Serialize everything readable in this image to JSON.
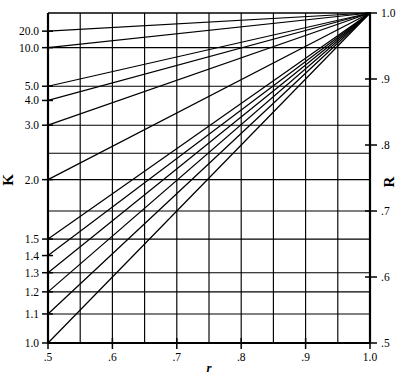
{
  "chart_data": {
    "type": "line",
    "title": "",
    "subtitle": "",
    "xlabel": "r",
    "ylabel": "K",
    "y2label": "R",
    "grid": true,
    "legend": null,
    "legend_position": "none",
    "xlim": [
      0.5,
      1.0
    ],
    "ylim_left_labels": [
      "1.0",
      "1.1",
      "1.2",
      "1.3",
      "1.4",
      "1.5",
      "2.0",
      "3.0",
      "4.0",
      "5.0",
      "10.0",
      "20.0"
    ],
    "ylim_right": [
      0.5,
      1.0
    ],
    "x_ticks": [
      {
        "value": 0.5,
        "label": ".5"
      },
      {
        "value": 0.6,
        "label": ".6"
      },
      {
        "value": 0.7,
        "label": ".7"
      },
      {
        "value": 0.8,
        "label": ".8"
      },
      {
        "value": 0.9,
        "label": ".9"
      },
      {
        "value": 1.0,
        "label": "1.0"
      }
    ],
    "y_left_ticks": [
      {
        "label": "20.0",
        "pos": 0.055
      },
      {
        "label": "10.0",
        "pos": 0.105
      },
      {
        "label": "5.0",
        "pos": 0.222
      },
      {
        "label": "4.0",
        "pos": 0.265
      },
      {
        "label": "3.0",
        "pos": 0.34
      },
      {
        "label": "2.0",
        "pos": 0.505
      },
      {
        "label": "1.5",
        "pos": 0.685
      },
      {
        "label": "1.4",
        "pos": 0.735
      },
      {
        "label": "1.3",
        "pos": 0.787
      },
      {
        "label": "1.2",
        "pos": 0.845
      },
      {
        "label": "1.1",
        "pos": 0.912
      },
      {
        "label": "1.0",
        "pos": 1.0
      }
    ],
    "y_right_ticks": [
      {
        "label": "1.0",
        "pos": 0.0
      },
      {
        "label": ".9",
        "pos": 0.2
      },
      {
        "label": ".8",
        "pos": 0.4
      },
      {
        "label": ".7",
        "pos": 0.6
      },
      {
        "label": ".6",
        "pos": 0.8
      },
      {
        "label": ".5",
        "pos": 1.0
      }
    ],
    "grid_x_divisions": 10,
    "grid_y_positions": [
      0.0,
      0.105,
      0.222,
      0.34,
      0.425,
      0.505,
      0.6,
      0.685,
      0.787,
      0.845,
      0.912,
      1.0
    ],
    "convergence_point": {
      "x": 1.0,
      "y": 0.0
    },
    "series": [
      {
        "name": "K=20.0",
        "start_pos": 0.055,
        "values": [
          0.055,
          0.0
        ]
      },
      {
        "name": "K=10.0",
        "start_pos": 0.105,
        "values": [
          0.105,
          0.0
        ]
      },
      {
        "name": "K=5.0",
        "start_pos": 0.222,
        "values": [
          0.222,
          0.0
        ]
      },
      {
        "name": "K=4.0",
        "start_pos": 0.265,
        "values": [
          0.265,
          0.0
        ]
      },
      {
        "name": "K=3.0",
        "start_pos": 0.34,
        "values": [
          0.34,
          0.0
        ]
      },
      {
        "name": "K=2.0",
        "start_pos": 0.505,
        "values": [
          0.505,
          0.0
        ]
      },
      {
        "name": "K=1.5",
        "start_pos": 0.685,
        "values": [
          0.685,
          0.0
        ]
      },
      {
        "name": "K=1.4",
        "start_pos": 0.735,
        "values": [
          0.735,
          0.0
        ]
      },
      {
        "name": "K=1.3",
        "start_pos": 0.787,
        "values": [
          0.787,
          0.0
        ]
      },
      {
        "name": "K=1.2",
        "start_pos": 0.845,
        "values": [
          0.845,
          0.0
        ]
      },
      {
        "name": "K=1.1",
        "start_pos": 0.912,
        "values": [
          0.912,
          0.0
        ]
      },
      {
        "name": "K=1.0",
        "start_pos": 1.0,
        "values": [
          1.0,
          0.0
        ]
      }
    ],
    "colors": {
      "line": "#000000",
      "grid": "#000000",
      "axis": "#000000",
      "background": "#ffffff"
    }
  },
  "axes": {
    "left_letter": "K",
    "right_letter": "R",
    "bottom_letter": "r"
  }
}
